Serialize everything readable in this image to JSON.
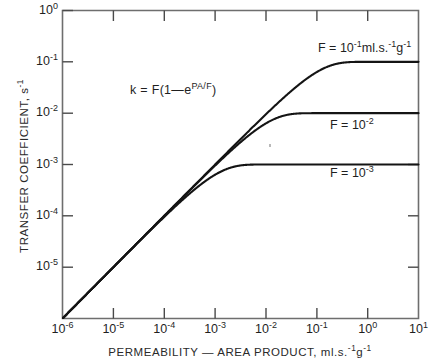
{
  "chart_data": {
    "type": "line",
    "title": "",
    "xlabel": "PERMEABILITY — AREA PRODUCT, ml.s.",
    "xlabel_sup": "-1",
    "xlabel_tail": "g",
    "xlabel_tail_sup": "-1",
    "ylabel": "TRANSFER COEFFICIENT, s",
    "ylabel_sup": "-1",
    "equation": "k = F(1—e",
    "equation_sup": "PA/F",
    "equation_tail": ")",
    "xlim_log": [
      -6,
      1
    ],
    "ylim_log": [
      -6,
      0
    ],
    "grid": false,
    "legend_position": "in-plot-right",
    "xticks": [
      {
        "exp": "-6",
        "base": "10"
      },
      {
        "exp": "-5",
        "base": "10"
      },
      {
        "exp": "-4",
        "base": "10"
      },
      {
        "exp": "-3",
        "base": "10"
      },
      {
        "exp": "-2",
        "base": "10"
      },
      {
        "exp": "-1",
        "base": "10"
      },
      {
        "exp": "0",
        "base": "10"
      },
      {
        "exp": "1",
        "base": "10"
      }
    ],
    "yticks": [
      {
        "exp": "0",
        "base": "10"
      },
      {
        "exp": "-1",
        "base": "10"
      },
      {
        "exp": "-2",
        "base": "10"
      },
      {
        "exp": "-3",
        "base": "10"
      },
      {
        "exp": "-4",
        "base": "10"
      },
      {
        "exp": "-5",
        "base": "10"
      }
    ],
    "series": [
      {
        "name": "F = 1e-1",
        "label_text": "F = 10",
        "label_sup": "-1",
        "label_mid": "ml.s.",
        "label_sup2": "-1",
        "label_tail": "g",
        "label_sup3": "-1",
        "plateau_log": -1,
        "F": 0.1
      },
      {
        "name": "F = 1e-2",
        "label_text": "F = 10",
        "label_sup": "-2",
        "label_mid": "",
        "label_sup2": "",
        "label_tail": "",
        "label_sup3": "",
        "plateau_log": -2,
        "F": 0.01
      },
      {
        "name": "F = 1e-3",
        "label_text": "F = 10",
        "label_sup": "-3",
        "label_mid": "",
        "label_sup2": "",
        "label_tail": "",
        "label_sup3": "",
        "plateau_log": -3,
        "F": 0.001
      }
    ],
    "model": "k = F(1 - exp(-PA/F))",
    "colors": {
      "curve": "#141414",
      "axis": "#6e6e6e",
      "text": "#1f1f1f"
    }
  }
}
